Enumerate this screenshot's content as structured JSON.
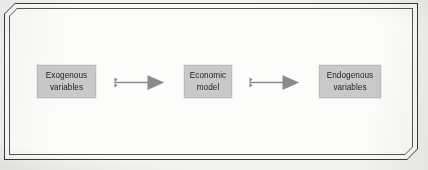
{
  "diagram": {
    "frame": {
      "style": "double-line-chamfered-box",
      "outer_border_color": "#3a3a3a",
      "inner_border_color": "#555553",
      "background_color": "#fcfcfb"
    },
    "nodes": [
      {
        "id": "exogenous",
        "label": "Exogenous\nvariables",
        "line1": "Exogenous",
        "line2": "variables",
        "fill_color": "#c9c9c9",
        "text_color": "#1d1d1d"
      },
      {
        "id": "model",
        "label": "Economic\nmodel",
        "line1": "Economic",
        "line2": "model",
        "fill_color": "#c9c9c9",
        "text_color": "#1d1d1d"
      },
      {
        "id": "endogenous",
        "label": "Endogenous\nvariables",
        "line1": "Endogenous",
        "line2": "variables",
        "fill_color": "#c9c9c9",
        "text_color": "#1d1d1d"
      }
    ],
    "arrows": [
      {
        "id": "arrow-1",
        "from": "exogenous",
        "to": "model",
        "direction": "right",
        "icon": "block-arrow-right-icon",
        "fill_color": "#8a8a8a"
      },
      {
        "id": "arrow-2",
        "from": "model",
        "to": "endogenous",
        "direction": "right",
        "icon": "block-arrow-right-icon",
        "fill_color": "#8a8a8a"
      }
    ]
  }
}
